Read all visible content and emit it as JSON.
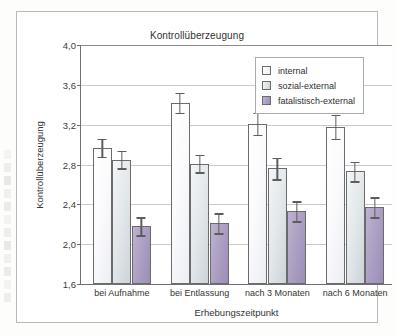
{
  "chart_data": {
    "type": "bar",
    "title": "Kontrollüberzeugung",
    "xlabel": "Erhebungszeitpunkt",
    "ylabel": "Kontrollüberzeugung",
    "ylim": [
      1.6,
      4.0
    ],
    "yticks": [
      "1,6",
      "2,0",
      "2,4",
      "2,8",
      "3,2",
      "3,6",
      "4,0"
    ],
    "ytick_values": [
      1.6,
      2.0,
      2.4,
      2.8,
      3.2,
      3.6,
      4.0
    ],
    "grid": true,
    "legend_position": "top-right",
    "error_bars": "present",
    "categories": [
      "bei Aufnahme",
      "bei Entlassung",
      "nach 3 Monaten",
      "nach 6 Monaten"
    ],
    "series": [
      {
        "name": "internal",
        "color": "#f7f8fb",
        "values": [
          2.97,
          3.42,
          3.21,
          3.18
        ],
        "errors": [
          0.09,
          0.1,
          0.11,
          0.12
        ]
      },
      {
        "name": "sozial-external",
        "color": "#d8dee2",
        "values": [
          2.85,
          2.81,
          2.76,
          2.73
        ],
        "errors": [
          0.09,
          0.09,
          0.11,
          0.1
        ]
      },
      {
        "name": "fatalistisch-external",
        "color": "#a99cc0",
        "values": [
          2.18,
          2.21,
          2.33,
          2.37
        ],
        "errors": [
          0.09,
          0.1,
          0.1,
          0.1
        ]
      }
    ]
  },
  "legend": {
    "entries": [
      "internal",
      "sozial-external",
      "fatalistisch-external"
    ]
  }
}
